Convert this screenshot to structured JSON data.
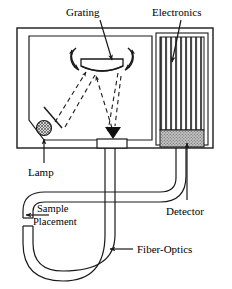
{
  "figure": {
    "type": "diagram",
    "line_color": "#1a1a1a",
    "detector_fill": "#b0b0b0",
    "lamp_fill": "#9a9a9a",
    "background": "#ffffff"
  },
  "labels": {
    "grating": "Grating",
    "electronics": "Electronics",
    "lamp": "Lamp",
    "detector": "Detector",
    "sample_line1": "Sample",
    "sample_line2": "Placement",
    "fiber_optics": "Fiber-Optics"
  },
  "components": {
    "housing": "instrument-housing",
    "monochromator": "monochromator-chamber",
    "grating": "diffraction-grating",
    "grating_rotation": "grating-rotation-arrows",
    "lamp": "light-source-lamp",
    "mirror": "folding-mirror",
    "exit_slit": "exit-slit",
    "electronics": "electronics-board",
    "detector": "array-detector",
    "fiber_source": "source-fiber-tube",
    "fiber_return": "return-fiber-tube",
    "sample_gap": "sample-placement-gap",
    "rays": "optical-ray-paths"
  }
}
